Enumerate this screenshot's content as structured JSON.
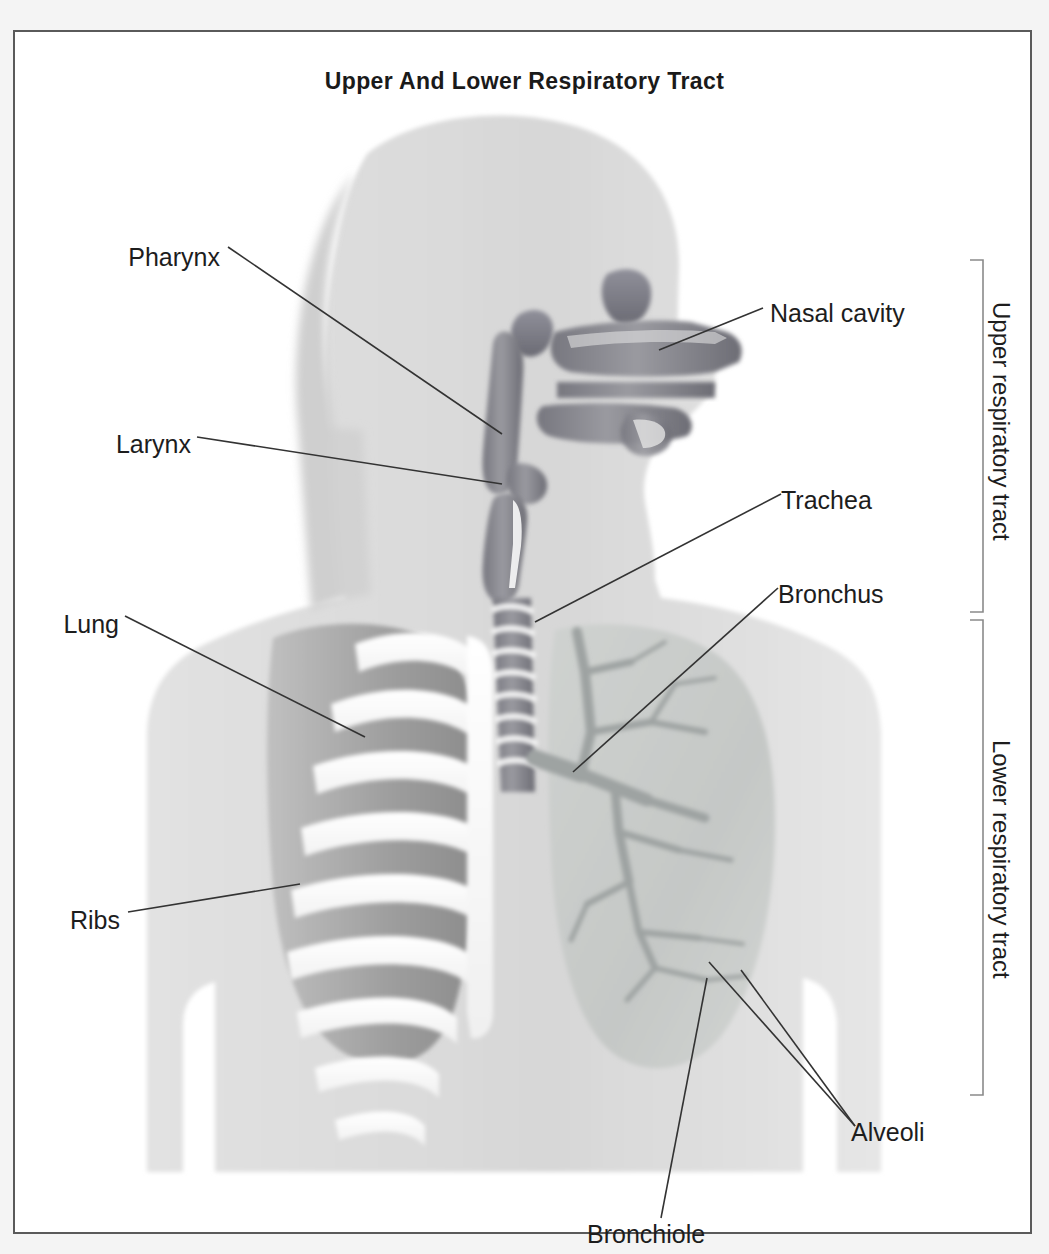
{
  "figure": {
    "title": "Upper And Lower Respiratory Tract",
    "type": "anatomical-diagram",
    "background_color": "#ffffff",
    "frame_color": "#5a5a5a",
    "label_color": "#1d1d1d",
    "leader_line_color": "#333333",
    "palette": {
      "body_silhouette": "#d9d9d9",
      "hair": "#cfcfcf",
      "airway_lumen": "#8f8f95",
      "airway_dark": "#6f6f78",
      "lung_fill": "#c8cbc9",
      "bronchial_tree": "#9ea3a2",
      "rib_bone": "#ffffff",
      "lung_behind_ribs": "#a9a9a9"
    }
  },
  "labels": {
    "left": [
      {
        "text": "Pharynx",
        "x": 118,
        "y": 225
      },
      {
        "text": "Larynx",
        "x": 108,
        "y": 412
      },
      {
        "text": "Lung",
        "x": 57,
        "y": 592
      },
      {
        "text": "Ribs",
        "x": 62,
        "y": 888
      }
    ],
    "right": [
      {
        "text": "Nasal cavity",
        "x": 768,
        "y": 281
      },
      {
        "text": "Trachea",
        "x": 779,
        "y": 468
      },
      {
        "text": "Bronchus",
        "x": 775,
        "y": 562
      },
      {
        "text": "Alveoli",
        "x": 849,
        "y": 1100
      }
    ],
    "bottom": [
      {
        "text": "Bronchiole",
        "x": 585,
        "y": 1202
      }
    ],
    "brackets": [
      {
        "text": "Upper respiratory tract",
        "top": 228,
        "bottom": 580
      },
      {
        "text": "Lower respiratory tract",
        "top": 588,
        "bottom": 1063
      }
    ]
  },
  "structures": [
    "nasal cavity",
    "frontal sinus",
    "sphenoid sinus",
    "hard palate",
    "tongue",
    "pharynx",
    "epiglottis",
    "larynx",
    "trachea",
    "bronchus",
    "bronchiole",
    "alveoli",
    "lung",
    "ribs"
  ]
}
